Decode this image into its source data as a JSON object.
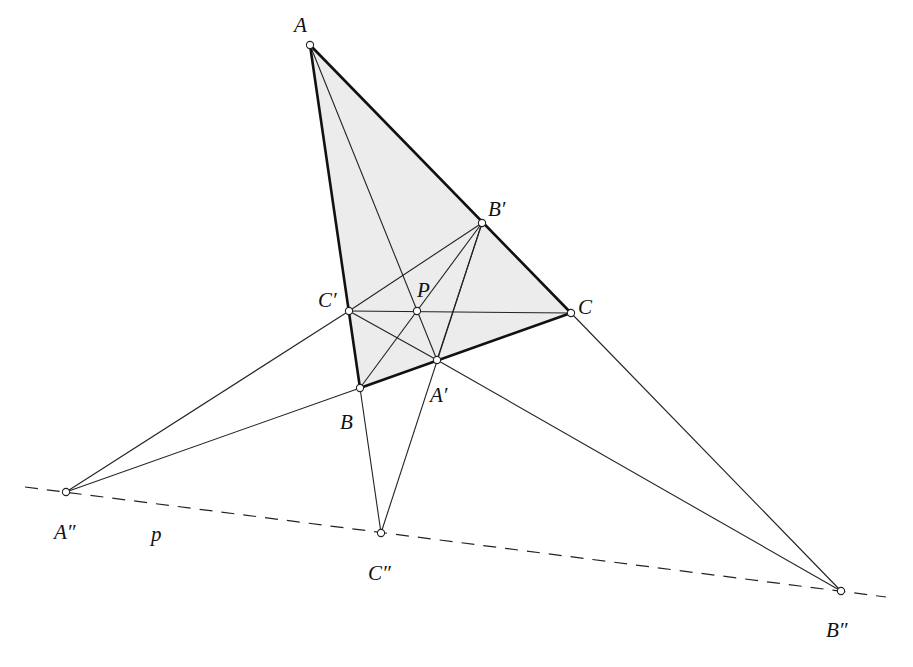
{
  "figure": {
    "type": "projective-geometry-diagram",
    "colors": {
      "stroke": "#111111",
      "fill": "#ececec",
      "point_fill": "#ffffff"
    }
  },
  "points": {
    "A": {
      "label": "A",
      "x": 310,
      "y": 45
    },
    "B": {
      "label": "B",
      "x": 360,
      "y": 388
    },
    "C": {
      "label": "C",
      "x": 571,
      "y": 313
    },
    "A1": {
      "label": "A′",
      "x": 437,
      "y": 360
    },
    "B1": {
      "label": "B′",
      "x": 482,
      "y": 223
    },
    "C1": {
      "label": "C′",
      "x": 349,
      "y": 311
    },
    "P": {
      "label": "P",
      "x": 417,
      "y": 311
    },
    "A2": {
      "label": "A″",
      "x": 66,
      "y": 492
    },
    "B2": {
      "label": "B″",
      "x": 841,
      "y": 591
    },
    "C2": {
      "label": "C″",
      "x": 381,
      "y": 533
    }
  },
  "line_label": {
    "p": "p"
  }
}
